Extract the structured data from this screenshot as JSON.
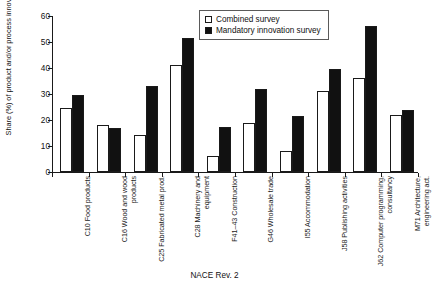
{
  "chart_data": {
    "type": "bar",
    "title": "",
    "xlabel": "NACE Rev. 2",
    "ylabel": "Share (%) of product and/or process innovators",
    "ylim": [
      0,
      60
    ],
    "yticks": [
      0,
      10,
      20,
      30,
      40,
      50,
      60
    ],
    "grid": false,
    "legend_position": "top-center",
    "categories": [
      "C10 Food products",
      "C16 Wood and wood products",
      "C25 Fabricated metal prod.",
      "C28 Machinery and equipment",
      "F41–43 Construction",
      "G46 Wholesale trade",
      "I55 Accommodation",
      "J58 Publishing activities",
      "J62 Computer programming, consultancy",
      "M71 Architecture, engineering act."
    ],
    "series": [
      {
        "name": "Combined survey",
        "color": "#ffffff",
        "values": [
          24.8,
          18.0,
          14.2,
          41.2,
          6.0,
          18.7,
          8.2,
          31.2,
          36.1,
          22.1
        ]
      },
      {
        "name": "Mandatory innovation survey",
        "color": "#111111",
        "values": [
          29.8,
          17.0,
          33.2,
          51.4,
          17.5,
          31.9,
          21.4,
          39.6,
          56.1,
          23.7
        ]
      }
    ]
  },
  "legend": {
    "items": [
      {
        "label": "Combined survey",
        "swatch": "open"
      },
      {
        "label": "Mandatory innovation survey",
        "swatch": "filled"
      }
    ]
  },
  "axes": {
    "y_title": "Share (%) of product and/or process innovators",
    "x_title": "NACE Rev. 2",
    "y_tick_labels": [
      "0",
      "10",
      "20",
      "30",
      "40",
      "50",
      "60"
    ]
  },
  "colors": {
    "combined_fill": "#ffffff",
    "mandatory_fill": "#111111",
    "axis": "#1a1a1a",
    "background": "#ffffff"
  }
}
